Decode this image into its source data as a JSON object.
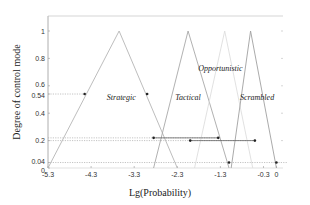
{
  "chart_data": {
    "type": "line",
    "title": "",
    "xlabel": "Lg(Probability)",
    "ylabel": "Degree of control mode",
    "xlim": [
      -5.3,
      0.25
    ],
    "ylim": [
      0,
      1.1
    ],
    "grid": false,
    "legend": "none (inline labels)",
    "x_ticks": [
      -5.3,
      -4.3,
      -3.3,
      -2.3,
      -1.3,
      -0.3,
      0
    ],
    "x_tick_labels": [
      "-5.3",
      "-4.3",
      "-3.3",
      "-2.3",
      "-1.3",
      "-0.3",
      "0"
    ],
    "y_ticks": [
      0,
      0.04,
      0.2,
      0.4,
      0.54,
      0.6,
      0.8,
      1
    ],
    "y_tick_labels": [
      "0",
      "0.04",
      "0.2",
      "0.4",
      "0.54",
      "0.6",
      "0.8",
      "1"
    ],
    "series": [
      {
        "name": "Strategic",
        "shape": "triangle",
        "x": [
          -5.3,
          -3.65,
          -2.3
        ],
        "y": [
          0,
          1,
          0
        ],
        "color": "#b5b5b5"
      },
      {
        "name": "Tactical",
        "shape": "triangle",
        "x": [
          -2.85,
          -2.05,
          -1.1
        ],
        "y": [
          0,
          1,
          0
        ],
        "color": "#a8a8a8"
      },
      {
        "name": "Opportunistic",
        "shape": "triangle",
        "x": [
          -1.9,
          -1.2,
          -0.55
        ],
        "y": [
          0,
          1,
          0
        ],
        "color": "#dedede"
      },
      {
        "name": "Scrambled",
        "shape": "triangle",
        "x": [
          -1.05,
          -0.6,
          0
        ],
        "y": [
          0,
          1,
          0
        ],
        "color": "#a0a0a0"
      }
    ],
    "annotations": [
      {
        "type": "hline",
        "y": 0.54,
        "x_from": -5.3,
        "x_to": -4.45,
        "style": "dotted"
      },
      {
        "type": "points",
        "x": [
          -4.45,
          -3.0
        ],
        "y": [
          0.54,
          0.54
        ]
      },
      {
        "type": "hline",
        "y": 0.22,
        "x_from": -5.3,
        "x_to": -1.35,
        "style": "dotted"
      },
      {
        "type": "hline_solid",
        "y": 0.22,
        "x_from": -2.85,
        "x_to": -1.35
      },
      {
        "type": "points",
        "x": [
          -2.85,
          -1.35
        ],
        "y": [
          0.22,
          0.22
        ]
      },
      {
        "type": "hline",
        "y": 0.2,
        "x_from": -5.3,
        "x_to": -0.5,
        "style": "dotted"
      },
      {
        "type": "hline_solid",
        "y": 0.2,
        "x_from": -2.0,
        "x_to": -0.5
      },
      {
        "type": "points",
        "x": [
          -2.0,
          -0.5
        ],
        "y": [
          0.2,
          0.2
        ]
      },
      {
        "type": "hline",
        "y": 0.04,
        "x_from": -5.3,
        "x_to": 0.25,
        "style": "dotted"
      },
      {
        "type": "points",
        "x": [
          -1.1,
          0
        ],
        "y": [
          0.04,
          0.04
        ]
      }
    ],
    "labels": [
      {
        "text": "Strategic",
        "x": -3.6,
        "y": 0.5
      },
      {
        "text": "Tactical",
        "x": -2.05,
        "y": 0.5
      },
      {
        "text": "Opportunistic",
        "x": -1.3,
        "y": 0.71
      },
      {
        "text": "Scrambled",
        "x": -0.45,
        "y": 0.5
      }
    ]
  },
  "axes": {
    "xlabel": "Lg(Probability)",
    "ylabel": "Degree of control mode"
  }
}
